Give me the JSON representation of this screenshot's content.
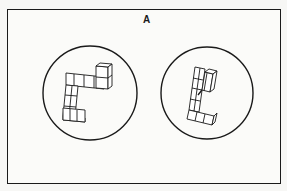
{
  "figure": {
    "label": "A",
    "colors": {
      "line": "#1a1a1a",
      "background": "#fbfbf9"
    },
    "items": [
      {
        "id": "left-object",
        "shape": "circle",
        "cx": 90,
        "cy": 93,
        "r": 47
      },
      {
        "id": "right-object",
        "shape": "circle",
        "cx": 207,
        "cy": 93,
        "r": 46
      }
    ]
  }
}
